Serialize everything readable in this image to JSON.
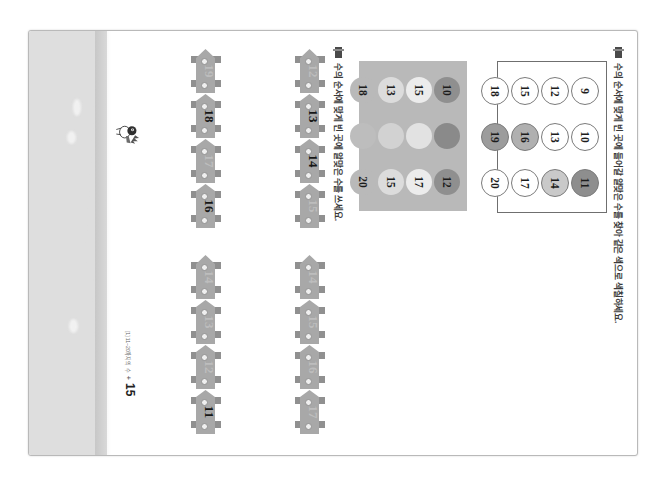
{
  "document": {
    "kind": "scanned-worksheet-page",
    "page_number": "15",
    "footer_label": "[1] 11~20까지의 수",
    "footer_plus": "+"
  },
  "mascot": {
    "name": "cartoon-mascot"
  },
  "questions": [
    {
      "marker": "question-marker",
      "text": "수의 순서에 맞게 빈 곳에 들어갈 알맞은 수를 찾아 같은 색으로 색칠하세요."
    },
    {
      "marker": "question-marker",
      "text": "수의 순서에 맞게 빈 곳에 알맞은 수를 쓰세요."
    }
  ],
  "number_grid": {
    "rows": [
      [
        {
          "value": "9",
          "fill": "#ffffff"
        },
        {
          "value": "10",
          "fill": "#ffffff"
        },
        {
          "value": "11",
          "fill": "#8e8e8e"
        }
      ],
      [
        {
          "value": "12",
          "fill": "#ffffff"
        },
        {
          "value": "13",
          "fill": "#ffffff"
        },
        {
          "value": "14",
          "fill": "#c9c9c9"
        }
      ],
      [
        {
          "value": "15",
          "fill": "#ffffff"
        },
        {
          "value": "16",
          "fill": "#b0b0b0"
        },
        {
          "value": "17",
          "fill": "#ffffff"
        }
      ],
      [
        {
          "value": "18",
          "fill": "#ffffff"
        },
        {
          "value": "19",
          "fill": "#9c9c9c"
        },
        {
          "value": "20",
          "fill": "#ffffff"
        }
      ]
    ]
  },
  "color_palette": {
    "panel_color": "#b9b9b9",
    "rows": [
      [
        {
          "value": "10",
          "fill": "#8f8f8f"
        },
        {
          "value": "",
          "fill": "#8a8a8a"
        },
        {
          "value": "12",
          "fill": "#8f8f8f"
        }
      ],
      [
        {
          "value": "15",
          "fill": "#ececec"
        },
        {
          "value": "",
          "fill": "#e2e2e2"
        },
        {
          "value": "17",
          "fill": "#ececec"
        }
      ],
      [
        {
          "value": "13",
          "fill": "#dcdcdc"
        },
        {
          "value": "",
          "fill": "#d2d2d2"
        },
        {
          "value": "15",
          "fill": "#dcdcdc"
        }
      ],
      [
        {
          "value": "18",
          "fill": "#b9b9b9"
        },
        {
          "value": "",
          "fill": "#bdbdbd"
        },
        {
          "value": "20",
          "fill": "#b9b9b9"
        }
      ]
    ]
  },
  "trains": [
    {
      "name": "train-top-left",
      "cars": [
        {
          "value": "12",
          "state": "blank"
        },
        {
          "value": "13",
          "state": "filled"
        },
        {
          "value": "14",
          "state": "filled"
        },
        {
          "value": "15",
          "state": "blank"
        }
      ]
    },
    {
      "name": "train-top-right",
      "cars": [
        {
          "value": "14",
          "state": "blank"
        },
        {
          "value": "15",
          "state": "blank"
        },
        {
          "value": "16",
          "state": "blank"
        },
        {
          "value": "17",
          "state": "blank"
        }
      ]
    },
    {
      "name": "train-bottom-left",
      "cars": [
        {
          "value": "19",
          "state": "blank"
        },
        {
          "value": "18",
          "state": "filled"
        },
        {
          "value": "17",
          "state": "blank"
        },
        {
          "value": "16",
          "state": "filled"
        }
      ]
    },
    {
      "name": "train-bottom-right",
      "cars": [
        {
          "value": "14",
          "state": "blank"
        },
        {
          "value": "13",
          "state": "blank"
        },
        {
          "value": "12",
          "state": "blank"
        },
        {
          "value": "11",
          "state": "filled"
        }
      ]
    }
  ]
}
